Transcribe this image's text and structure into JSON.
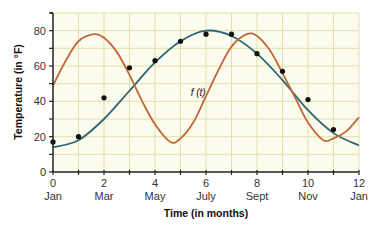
{
  "chart_data": {
    "type": "scatter",
    "title": "",
    "xlabel": "Time (in months)",
    "ylabel": "Temperature (in °F)",
    "xlim": [
      0,
      12
    ],
    "ylim": [
      0,
      90
    ],
    "grid": true,
    "grid_color": "#dfe3a8",
    "x_ticks": [
      0,
      2,
      4,
      6,
      8,
      10,
      12
    ],
    "x_tick_labels": [
      "0",
      "2",
      "4",
      "6",
      "8",
      "10",
      "12"
    ],
    "x_month_labels": [
      "Jan",
      "Mar",
      "May",
      "July",
      "Sept",
      "Nov",
      "Jan"
    ],
    "y_ticks": [
      0,
      20,
      40,
      60,
      80
    ],
    "y_tick_labels": [
      "0",
      "20",
      "40",
      "60",
      "80"
    ],
    "points": {
      "name": "Observed temperatures",
      "color": "#111111",
      "x": [
        0,
        1,
        2,
        3,
        4,
        5,
        6,
        7,
        8,
        9,
        10,
        11
      ],
      "y": [
        17,
        20,
        42,
        59,
        63,
        74,
        78,
        78,
        67,
        57,
        41,
        24
      ]
    },
    "series": [
      {
        "name": "f(t)",
        "type": "line",
        "color": "#2f6675",
        "x": [
          0,
          1,
          2,
          3,
          4,
          5,
          6,
          7,
          8,
          9,
          10,
          11,
          12
        ],
        "y": [
          14,
          18,
          30,
          46,
          62,
          74,
          80,
          77,
          67,
          52,
          35,
          22,
          15
        ]
      },
      {
        "name": "orange curve",
        "type": "line",
        "color": "#c1683a",
        "x": [
          0,
          0.5,
          1,
          1.6,
          2,
          2.5,
          3,
          3.5,
          4,
          4.6,
          5,
          5.5,
          6,
          6.5,
          7,
          7.6,
          8,
          8.5,
          9,
          9.5,
          10,
          10.6,
          11,
          11.5,
          12
        ],
        "y": [
          49,
          63,
          74,
          78,
          76,
          68,
          55,
          40,
          27,
          17,
          19,
          28,
          43,
          58,
          71,
          78,
          77,
          69,
          56,
          42,
          28,
          18,
          19,
          23,
          31
        ]
      }
    ],
    "annotations": [
      {
        "text": "f (t)",
        "x": 5.4,
        "y": 43
      }
    ]
  }
}
